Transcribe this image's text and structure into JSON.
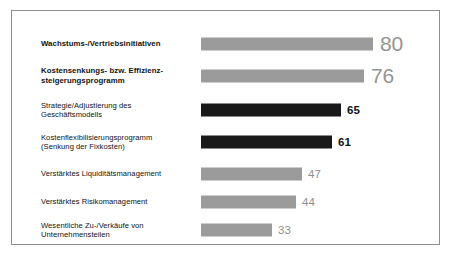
{
  "chart_data": {
    "type": "bar",
    "orientation": "horizontal",
    "title": "",
    "subtitle": "",
    "xlabel": "",
    "ylabel": "",
    "xlim": [
      0,
      100
    ],
    "grid": false,
    "legend": "none",
    "categories": [
      "Wachstums-/Vertriebsinitiativen",
      "Kostensenkungs- bzw. Effizienz-\nsteigerungsprogramm",
      "Strategie/Adjustierung des\nGeschäftsmodells",
      "Kostenflexibilisierungsprogramm\n(Senkung der Fixkosten)",
      "Verstärktes Liquiditätsmanagement",
      "Verstärktes Risikomanagement",
      "Wesentliche Zu-/Verkäufe von\nUnternehmensteilen"
    ],
    "values": [
      80,
      76,
      65,
      61,
      47,
      44,
      33
    ],
    "value_labels": [
      "80",
      "76",
      "65",
      "61",
      "47",
      "44",
      "33"
    ],
    "bar_colors": [
      "#9b9b9b",
      "#9b9b9b",
      "#191919",
      "#191919",
      "#9b9b9b",
      "#9b9b9b",
      "#9b9b9b"
    ],
    "label_emphasis": [
      "bold",
      "bold",
      "normal",
      "normal",
      "normal",
      "normal",
      "normal"
    ],
    "value_label_colors": [
      "#949494",
      "#949494",
      "#111111",
      "#111111",
      "#8f8f8f",
      "#8f8f8f",
      "#8f8f8f"
    ]
  },
  "rows": [
    {
      "label": "Wachstums-/Vertriebsinitiativen",
      "value": "80",
      "value_num": 80,
      "bar_color": "#9b9b9b",
      "label_weight": "bold",
      "value_style": "big"
    },
    {
      "label": "Kostensenkungs- bzw. Effizienz-\nsteigerungsprogramm",
      "value": "76",
      "value_num": 76,
      "bar_color": "#9b9b9b",
      "label_weight": "bold",
      "value_style": "big"
    },
    {
      "label": "Strategie/Adjustierung des\nGeschäftsmodells",
      "value": "65",
      "value_num": 65,
      "bar_color": "#191919",
      "label_weight": "normal",
      "value_style": "small-black"
    },
    {
      "label": "Kostenflexibilisierungsprogramm\n(Senkung der Fixkosten)",
      "value": "61",
      "value_num": 61,
      "bar_color": "#191919",
      "label_weight": "normal",
      "value_style": "small-black"
    },
    {
      "label": "Verstärktes Liquiditätsmanagement",
      "value": "47",
      "value_num": 47,
      "bar_color": "#9b9b9b",
      "label_weight": "normal",
      "value_style": "small-gray"
    },
    {
      "label": "Verstärktes Risikomanagement",
      "value": "44",
      "value_num": 44,
      "bar_color": "#9b9b9b",
      "label_weight": "normal",
      "value_style": "small-gray"
    },
    {
      "label": "Wesentliche Zu-/Verkäufe von\nUnternehmensteilen",
      "value": "33",
      "value_num": 33,
      "bar_color": "#9b9b9b",
      "label_weight": "normal",
      "value_style": "small-gray"
    }
  ],
  "layout": {
    "bar_area_width_px": 172,
    "scale_max": 80,
    "scale_max_width_px": 172,
    "row_tops_px": [
      18,
      50,
      84,
      116,
      148,
      176,
      204
    ],
    "frame_color": "#8e8e8e",
    "background": "#ffffff"
  }
}
